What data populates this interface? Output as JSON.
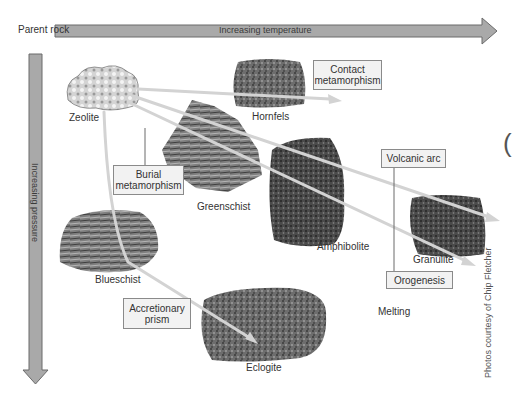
{
  "axes": {
    "parent_rock_label": "Parent rock",
    "temperature_label": "Increasing temperature",
    "pressure_label": "Increasing pressure"
  },
  "rocks": [
    {
      "id": "zeolite",
      "label": "Zeolite",
      "role": "parent"
    },
    {
      "id": "hornfels",
      "label": "Hornfels"
    },
    {
      "id": "greenschist",
      "label": "Greenschist"
    },
    {
      "id": "amphibolite",
      "label": "Amphibolite"
    },
    {
      "id": "granulite",
      "label": "Granulite"
    },
    {
      "id": "blueschist",
      "label": "Blueschist"
    },
    {
      "id": "eclogite",
      "label": "Eclogite"
    }
  ],
  "settings": [
    {
      "id": "contact",
      "label_line1": "Contact",
      "label_line2": "metamorphism"
    },
    {
      "id": "burial",
      "label_line1": "Burial",
      "label_line2": "metamorphism"
    },
    {
      "id": "volcanic_arc",
      "label_line1": "Volcanic arc"
    },
    {
      "id": "orogenesis",
      "label_line1": "Orogenesis"
    },
    {
      "id": "accretionary",
      "label_line1": "Accretionary",
      "label_line2": "prism"
    }
  ],
  "melting_label": "Melting",
  "credit": "Photos courtesy of Chip Fletcher",
  "edge_glyph": "(",
  "colors": {
    "arrow_fill": "#a9a9a9",
    "arrow_stroke": "#6b6b6b",
    "path_line": "#cfcfcf",
    "box_fill": "#f2f2f2",
    "box_border": "#8a8a8a"
  },
  "paths": [
    {
      "from": "zeolite",
      "via": [
        "hornfels"
      ],
      "setting": "contact"
    },
    {
      "from": "zeolite",
      "via": [
        "greenschist"
      ],
      "setting": "volcanic_arc"
    },
    {
      "from": "zeolite",
      "via": [
        "greenschist",
        "amphibolite",
        "granulite"
      ],
      "setting": "orogenesis"
    },
    {
      "from": "zeolite",
      "via": [
        "blueschist",
        "eclogite"
      ],
      "setting": "accretionary"
    }
  ]
}
